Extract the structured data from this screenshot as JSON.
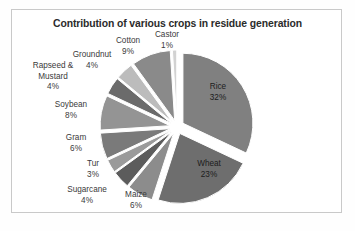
{
  "chart_data": {
    "type": "pie",
    "title": "Contribution of various crops in residue generation",
    "xlabel": "",
    "ylabel": "",
    "legend": "none",
    "grid": false,
    "exploded": true,
    "unit": "%",
    "categories": [
      "Rice",
      "Wheat",
      "Maize",
      "Sugarcane",
      "Tur",
      "Gram",
      "Soybean",
      "Rapseed & Mustard",
      "Groundnut",
      "Cotton",
      "Castor"
    ],
    "values": [
      32,
      23,
      6,
      4,
      3,
      6,
      8,
      4,
      4,
      9,
      1
    ],
    "slices": [
      {
        "label": "Rice",
        "value": 32,
        "pct_text": "32%",
        "color": "#808080",
        "label_pos": "inner"
      },
      {
        "label": "Wheat",
        "value": 23,
        "pct_text": "23%",
        "color": "#6e6e6e",
        "label_pos": "inner"
      },
      {
        "label": "Maize",
        "value": 6,
        "pct_text": "6%",
        "color": "#8c8c8c",
        "label_pos": "outer"
      },
      {
        "label": "Sugarcane",
        "value": 4,
        "pct_text": "4%",
        "color": "#5c5c5c",
        "label_pos": "outer"
      },
      {
        "label": "Tur",
        "value": 3,
        "pct_text": "3%",
        "color": "#9a9a9a",
        "label_pos": "outer"
      },
      {
        "label": "Gram",
        "value": 6,
        "pct_text": "6%",
        "color": "#7a7a7a",
        "label_pos": "outer"
      },
      {
        "label": "Soybean",
        "value": 8,
        "pct_text": "8%",
        "color": "#949494",
        "label_pos": "outer"
      },
      {
        "label": "Rapseed & Mustard",
        "value": 4,
        "pct_text": "4%",
        "color": "#6b6b6b",
        "label_pos": "outer"
      },
      {
        "label": "Groundnut",
        "value": 4,
        "pct_text": "4%",
        "color": "#bcbcbc",
        "label_pos": "outer"
      },
      {
        "label": "Cotton",
        "value": 9,
        "pct_text": "9%",
        "color": "#8a8a8a",
        "label_pos": "outer"
      },
      {
        "label": "Castor",
        "value": 1,
        "pct_text": "1%",
        "color": "#d2d2d2",
        "label_pos": "outer"
      }
    ]
  },
  "labels": {
    "castor": {
      "name": "Castor",
      "pct": "1%"
    },
    "cotton": {
      "name": "Cotton",
      "pct": "9%"
    },
    "groundnut": {
      "name": "Groundnut",
      "pct": "4%"
    },
    "rapseed": {
      "name": "Rapseed &",
      "name2": "Mustard",
      "pct": "4%"
    },
    "soybean": {
      "name": "Soybean",
      "pct": "8%"
    },
    "gram": {
      "name": "Gram",
      "pct": "6%"
    },
    "tur": {
      "name": "Tur",
      "pct": "3%"
    },
    "sugarcane": {
      "name": "Sugarcane",
      "pct": "4%"
    },
    "maize": {
      "name": "Maize",
      "pct": "6%"
    },
    "rice": {
      "name": "Rice",
      "pct": "32%"
    },
    "wheat": {
      "name": "Wheat",
      "pct": "23%"
    }
  }
}
